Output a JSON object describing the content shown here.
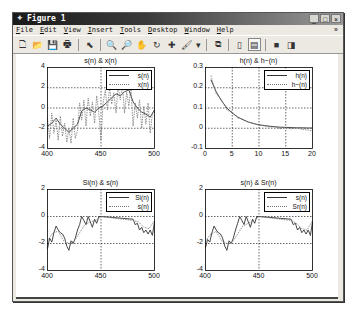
{
  "window": {
    "title": "Figure 1",
    "controls": [
      "minimize",
      "maximize",
      "close"
    ]
  },
  "menubar": {
    "items": [
      "File",
      "Edit",
      "View",
      "Insert",
      "Tools",
      "Desktop",
      "Window",
      "Help"
    ],
    "overflow_arrow": "»"
  },
  "toolbar": {
    "buttons": [
      {
        "name": "new-figure",
        "glyph": "🗋"
      },
      {
        "name": "open-file",
        "glyph": "📂"
      },
      {
        "name": "save-figure",
        "glyph": "💾"
      },
      {
        "name": "print-figure",
        "glyph": "🖶"
      },
      {
        "name": "edit-plot",
        "glyph": "⬉"
      },
      {
        "name": "zoom-in",
        "glyph": "🔍"
      },
      {
        "name": "zoom-out",
        "glyph": "🔎"
      },
      {
        "name": "pan",
        "glyph": "✋"
      },
      {
        "name": "rotate-3d",
        "glyph": "↻"
      },
      {
        "name": "data-cursor",
        "glyph": "✚"
      },
      {
        "name": "brush",
        "glyph": "🖌"
      },
      {
        "name": "brush-dropdown",
        "glyph": "▾"
      },
      {
        "name": "link-plot",
        "glyph": "⧉"
      },
      {
        "name": "insert-colorbar",
        "glyph": "▯"
      },
      {
        "name": "insert-legend",
        "glyph": "▤"
      },
      {
        "name": "hide-plot-tools",
        "glyph": "■"
      },
      {
        "name": "show-plot-tools",
        "glyph": "◨"
      }
    ]
  },
  "chart_data": [
    {
      "type": "line",
      "title": "s(n) & x(n)",
      "xlim": [
        400,
        500
      ],
      "ylim": [
        -4,
        4
      ],
      "xticks": [
        "400",
        "450",
        "500"
      ],
      "yticks": [
        "4",
        "2",
        "0",
        "-2",
        "-4"
      ],
      "grid": true,
      "legend": {
        "position": "northeast",
        "entries": [
          "s(n)",
          "x(n)"
        ]
      },
      "series": [
        {
          "name": "s(n)",
          "style": "solid",
          "x": [
            400,
            404,
            408,
            412,
            416,
            420,
            424,
            428,
            432,
            436,
            440,
            444,
            448,
            452,
            456,
            460,
            464,
            468,
            472,
            476,
            480,
            484,
            488,
            492,
            496,
            500
          ],
          "y": [
            -1.8,
            -1.5,
            -1.0,
            -1.6,
            -2.0,
            -2.4,
            -2.0,
            -1.6,
            -0.3,
            0.0,
            -0.2,
            -0.4,
            0.0,
            0.2,
            0.6,
            1.0,
            1.4,
            1.2,
            1.6,
            1.8,
            0.6,
            0.0,
            -0.4,
            -0.6,
            -0.9,
            -0.2
          ]
        },
        {
          "name": "x(n)",
          "style": "dotted",
          "x": [
            400,
            402,
            404,
            406,
            408,
            410,
            412,
            414,
            416,
            418,
            420,
            422,
            424,
            426,
            428,
            430,
            432,
            434,
            436,
            438,
            440,
            442,
            444,
            446,
            448,
            450,
            452,
            454,
            456,
            458,
            460,
            462,
            464,
            466,
            468,
            470,
            472,
            474,
            476,
            478,
            480,
            482,
            484,
            486,
            488,
            490,
            492,
            494,
            496,
            498,
            500
          ],
          "y": [
            -1.0,
            -3.0,
            -0.5,
            -2.5,
            -1.2,
            -3.2,
            -0.8,
            -2.8,
            -1.5,
            -3.4,
            -2.0,
            -3.5,
            -1.0,
            -3.0,
            -2.2,
            0.5,
            -1.2,
            0.8,
            -1.8,
            1.0,
            -0.8,
            0.6,
            -1.5,
            1.2,
            -0.6,
            -3.2,
            0.5,
            1.8,
            -0.2,
            2.0,
            0.4,
            1.5,
            -0.5,
            2.2,
            0.8,
            2.4,
            -0.5,
            1.6,
            0.2,
            2.0,
            -1.8,
            0.5,
            -1.0,
            0.8,
            -2.0,
            0.2,
            -1.6,
            0.5,
            -2.5,
            -0.5,
            -0.2
          ]
        }
      ]
    },
    {
      "type": "line",
      "title": "h(n) & h~(n)",
      "xlim": [
        0,
        20
      ],
      "ylim": [
        -0.1,
        0.3
      ],
      "xticks": [
        "0",
        "5",
        "10",
        "15",
        "20"
      ],
      "yticks": [
        "0.3",
        "0.2",
        "0.1",
        "0",
        "-0.1"
      ],
      "grid": true,
      "legend": {
        "position": "northeast",
        "entries": [
          "h(n)",
          "h~(n)"
        ]
      },
      "series": [
        {
          "name": "h(n)",
          "style": "solid",
          "x": [
            1,
            2,
            3,
            4,
            5,
            6,
            7,
            8,
            9,
            10,
            11,
            12,
            13,
            14,
            15,
            16,
            17,
            18,
            19,
            20
          ],
          "y": [
            0.24,
            0.18,
            0.135,
            0.1,
            0.075,
            0.056,
            0.042,
            0.031,
            0.023,
            0.017,
            0.013,
            0.01,
            0.007,
            0.005,
            0.004,
            0.003,
            0.002,
            0.002,
            0.001,
            0.001
          ]
        },
        {
          "name": "h~(n)",
          "style": "dotted",
          "x": [
            1,
            2,
            3,
            4,
            5,
            6,
            7,
            8,
            9,
            10,
            11,
            12,
            13,
            14,
            15,
            16,
            17,
            18,
            19,
            20
          ],
          "y": [
            0.26,
            0.17,
            0.14,
            0.09,
            0.08,
            0.05,
            0.045,
            0.03,
            0.025,
            0.015,
            0.012,
            0.005,
            0.008,
            -0.002,
            0.004,
            -0.003,
            0.002,
            -0.005,
            -0.008,
            -0.012
          ]
        }
      ]
    },
    {
      "type": "line",
      "title": "Si(n) & s(n)",
      "xlim": [
        400,
        500
      ],
      "ylim": [
        -4,
        2
      ],
      "xticks": [
        "400",
        "450",
        "500"
      ],
      "yticks": [
        "2",
        "0",
        "-2",
        "-4"
      ],
      "grid": true,
      "legend": {
        "position": "northeast",
        "entries": [
          "Si(n)",
          "s(n)"
        ]
      },
      "series": [
        {
          "name": "Si(n)",
          "style": "solid",
          "x": [
            400,
            402,
            404,
            406,
            408,
            410,
            412,
            414,
            416,
            418,
            420,
            422,
            424,
            426,
            428,
            430,
            432,
            434,
            436,
            438,
            440,
            442,
            444,
            446,
            448,
            450,
            480,
            482,
            484,
            486,
            488,
            490,
            492,
            494,
            496,
            498,
            500
          ],
          "y": [
            -2.4,
            -1.6,
            -1.9,
            -1.2,
            -0.7,
            -1.0,
            -1.2,
            -1.3,
            -1.6,
            -2.2,
            -2.5,
            -1.8,
            -2.0,
            -1.6,
            -1.0,
            -0.6,
            0.0,
            -0.3,
            -0.6,
            0.0,
            -0.4,
            -0.8,
            -0.2,
            -0.5,
            0.0,
            0.0,
            -0.2,
            -0.6,
            -0.5,
            -1.0,
            -0.8,
            -1.2,
            -1.0,
            -1.3,
            -1.0,
            -1.4,
            -0.4
          ]
        },
        {
          "name": "s(n)",
          "style": "dotted",
          "x": [
            400,
            405,
            410,
            415,
            420,
            425,
            430,
            435,
            440,
            445,
            450,
            480,
            485,
            490,
            495,
            500
          ],
          "y": [
            -1.8,
            -1.2,
            -1.1,
            -1.8,
            -2.0,
            -1.8,
            -1.2,
            -0.6,
            -0.4,
            -0.3,
            0.0,
            -0.3,
            -0.4,
            -0.8,
            -0.9,
            -0.3
          ]
        }
      ]
    },
    {
      "type": "line",
      "title": "s(n) & Sr(n)",
      "xlim": [
        400,
        500
      ],
      "ylim": [
        -4,
        2
      ],
      "xticks": [
        "400",
        "450",
        "500"
      ],
      "yticks": [
        "2",
        "0",
        "-2",
        "-4"
      ],
      "grid": true,
      "legend": {
        "position": "northeast",
        "entries": [
          "s(n)",
          "Sr(n)"
        ]
      },
      "series": [
        {
          "name": "s(n)",
          "style": "solid",
          "x": [
            400,
            402,
            404,
            406,
            408,
            410,
            412,
            414,
            416,
            418,
            420,
            422,
            424,
            426,
            428,
            430,
            432,
            434,
            436,
            438,
            440,
            442,
            444,
            446,
            448,
            450,
            480,
            482,
            484,
            486,
            488,
            490,
            492,
            494,
            496,
            498,
            500
          ],
          "y": [
            -2.3,
            -1.7,
            -1.9,
            -1.2,
            -0.7,
            -1.0,
            -1.2,
            -1.3,
            -1.6,
            -2.2,
            -2.5,
            -1.8,
            -2.0,
            -1.6,
            -1.0,
            -0.5,
            0.0,
            -0.3,
            -0.6,
            0.0,
            -0.4,
            -0.8,
            -0.2,
            -0.5,
            0.0,
            0.0,
            -0.2,
            -0.6,
            -0.5,
            -1.0,
            -0.8,
            -1.2,
            -1.0,
            -1.3,
            -1.0,
            -1.4,
            -0.4
          ]
        },
        {
          "name": "Sr(n)",
          "style": "dotted",
          "x": [
            400,
            405,
            410,
            415,
            420,
            425,
            430,
            435,
            440,
            445,
            450,
            480,
            485,
            490,
            495,
            500
          ],
          "y": [
            -1.8,
            -1.3,
            -1.1,
            -1.8,
            -2.0,
            -1.9,
            -1.3,
            -0.7,
            -0.5,
            -0.3,
            0.0,
            -0.3,
            -0.5,
            -0.9,
            -1.0,
            -0.3
          ]
        }
      ]
    }
  ]
}
